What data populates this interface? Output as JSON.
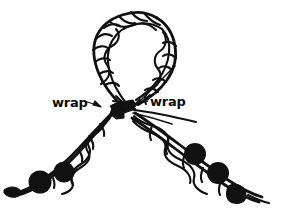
{
  "figure": {
    "background_color": "#ffffff",
    "ink_color": "#111111",
    "width": 294,
    "height": 217
  },
  "labels": {
    "left_wrap": "wrap",
    "right_wrap": "wrap"
  },
  "annotations": [
    {
      "name": "left-wrap-label",
      "text": "wrap",
      "x": 52,
      "y": 106,
      "arrow": "right"
    },
    {
      "name": "right-wrap-label",
      "text": "wrap",
      "x": 150,
      "y": 104,
      "arrow": "left"
    }
  ],
  "parts": {
    "loop_label": "braided loop",
    "knot_label": "wrapped knot",
    "left_arm_label": "left braided arm",
    "right_arm_label": "right braided arm",
    "left_arm_beads": 2,
    "right_arm_beads": 3,
    "loose_ends": 2
  }
}
